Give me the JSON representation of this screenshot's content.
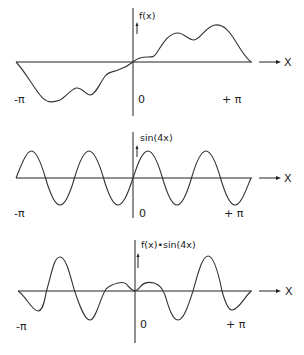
{
  "figure": {
    "panels": [
      {
        "id": "f",
        "ylabel": "f(x)",
        "xlabel": "X",
        "left_label": "-π",
        "origin_label": "0",
        "right_label": "+ π"
      },
      {
        "id": "sin4x",
        "ylabel": "sin(4x)",
        "xlabel": "X",
        "left_label": "-π",
        "origin_label": "0",
        "right_label": "+ π"
      },
      {
        "id": "product",
        "ylabel": "f(x)•sin(4x)",
        "xlabel": "X",
        "left_label": "-π",
        "origin_label": "0",
        "right_label": "+ π"
      }
    ]
  }
}
